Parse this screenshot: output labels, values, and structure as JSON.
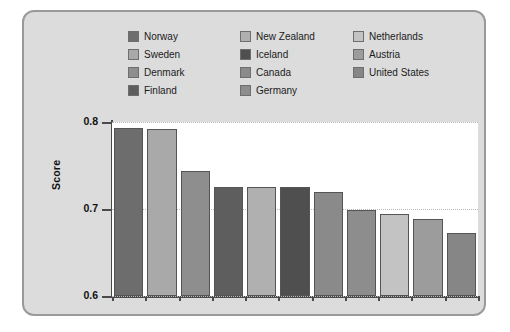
{
  "chart_data": {
    "type": "bar",
    "title": "",
    "xlabel": "",
    "ylabel": "Score",
    "ylim": [
      0.6,
      0.8
    ],
    "yticks": [
      "0.6",
      "0.7",
      "0.8"
    ],
    "grid": true,
    "legend_position": "top",
    "categories": [
      "Norway",
      "Sweden",
      "Denmark",
      "Finland",
      "New Zealand",
      "Iceland",
      "Canada",
      "Germany",
      "Netherlands",
      "Austria",
      "United States"
    ],
    "values": [
      0.793,
      0.792,
      0.744,
      0.725,
      0.725,
      0.725,
      0.72,
      0.699,
      0.694,
      0.689,
      0.672
    ],
    "colors": [
      "#6d6d6d",
      "#a9a9a9",
      "#8e8e8e",
      "#5e5e5e",
      "#b0b0b0",
      "#4f4f4f",
      "#8a8a8a",
      "#8d8d8d",
      "#c3c3c3",
      "#9c9c9c",
      "#868686"
    ]
  },
  "legend": {
    "columns": [
      {
        "items": [
          {
            "label": "Norway",
            "color": "#6d6d6d"
          },
          {
            "label": "Sweden",
            "color": "#a9a9a9"
          },
          {
            "label": "Denmark",
            "color": "#8e8e8e"
          },
          {
            "label": "Finland",
            "color": "#5e5e5e"
          }
        ]
      },
      {
        "items": [
          {
            "label": "New Zealand",
            "color": "#b0b0b0"
          },
          {
            "label": "Iceland",
            "color": "#4f4f4f"
          },
          {
            "label": "Canada",
            "color": "#8a8a8a"
          },
          {
            "label": "Germany",
            "color": "#8d8d8d"
          }
        ]
      },
      {
        "items": [
          {
            "label": "Netherlands",
            "color": "#c3c3c3"
          },
          {
            "label": "Austria",
            "color": "#9c9c9c"
          },
          {
            "label": "United States",
            "color": "#868686"
          }
        ]
      }
    ]
  },
  "axis": {
    "y_title": "Score",
    "ticks": [
      {
        "label": "0.8",
        "value": 0.8
      },
      {
        "label": "0.7",
        "value": 0.7
      },
      {
        "label": "0.6",
        "value": 0.6
      }
    ]
  }
}
